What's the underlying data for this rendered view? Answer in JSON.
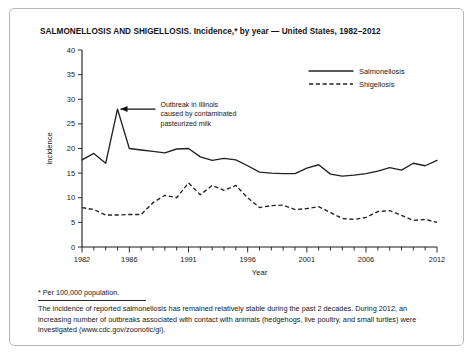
{
  "figure": {
    "title": "SALMONELLOSIS AND SHIGELLOSIS. Incidence,* by year — United States, 1982–2012"
  },
  "footnotes": {
    "star": "* Per 100,000 population.",
    "body": "The incidence of reported salmonellosis has remained relatively stable during the past 2 decades. During 2012, an increasing number of outbreaks associated with contact with animals (hedgehogs, live poultry, and small turtles) were investigated (www.cdc.gov/zoonotic/gi)."
  },
  "annotation": {
    "line1": "Outbreak in Illinois",
    "line2": "caused by contaminated",
    "line3": "pasteurized milk",
    "points_to_year": 1985,
    "points_to_value": 28.0
  },
  "chart_data": {
    "type": "line",
    "title": "SALMONELLOSIS AND SHIGELLOSIS. Incidence,* by year — United States, 1982–2012",
    "xlabel": "Year",
    "ylabel": "Incidence",
    "xlim": [
      1982,
      2012
    ],
    "ylim": [
      0,
      40
    ],
    "yticks": [
      0,
      5,
      10,
      15,
      20,
      25,
      30,
      35,
      40
    ],
    "xticks": [
      1982,
      1983,
      1984,
      1985,
      1986,
      1987,
      1988,
      1989,
      1990,
      1991,
      1992,
      1993,
      1994,
      1995,
      1996,
      1997,
      1998,
      1999,
      2000,
      2001,
      2002,
      2003,
      2004,
      2005,
      2006,
      2007,
      2008,
      2009,
      2010,
      2011,
      2012
    ],
    "xticklabels": [
      "1982",
      "1986",
      "1991",
      "1996",
      "2001",
      "2006",
      "2012"
    ],
    "xticklabel_years": [
      1982,
      1986,
      1991,
      1996,
      2001,
      2006,
      2012
    ],
    "grid": false,
    "legend_position": "upper right",
    "x": [
      1982,
      1983,
      1984,
      1985,
      1986,
      1987,
      1988,
      1989,
      1990,
      1991,
      1992,
      1993,
      1994,
      1995,
      1996,
      1997,
      1998,
      1999,
      2000,
      2001,
      2002,
      2003,
      2004,
      2005,
      2006,
      2007,
      2008,
      2009,
      2010,
      2011,
      2012
    ],
    "series": [
      {
        "name": "Salmonellosis",
        "style": "solid",
        "values": [
          17.7,
          19.0,
          17.0,
          28.0,
          20.0,
          19.7,
          19.4,
          19.1,
          19.9,
          20.0,
          18.3,
          17.6,
          18.0,
          17.7,
          16.5,
          15.2,
          15.0,
          14.9,
          14.9,
          16.0,
          16.7,
          14.8,
          14.4,
          14.6,
          14.9,
          15.4,
          16.1,
          15.6,
          17.0,
          16.5,
          17.6
        ]
      },
      {
        "name": "Shigellosis",
        "style": "dashed",
        "values": [
          8.0,
          7.6,
          6.5,
          6.5,
          6.6,
          6.6,
          9.0,
          10.5,
          10.0,
          13.0,
          10.6,
          12.5,
          11.5,
          12.5,
          10.0,
          8.0,
          8.4,
          8.5,
          7.6,
          7.8,
          8.2,
          7.0,
          5.8,
          5.6,
          6.0,
          7.2,
          7.4,
          6.4,
          5.4,
          5.6,
          5.0
        ]
      }
    ]
  },
  "legend": {
    "items": [
      {
        "label": "Salmonellosis",
        "style": "solid"
      },
      {
        "label": "Shigellosis",
        "style": "dashed"
      }
    ]
  }
}
